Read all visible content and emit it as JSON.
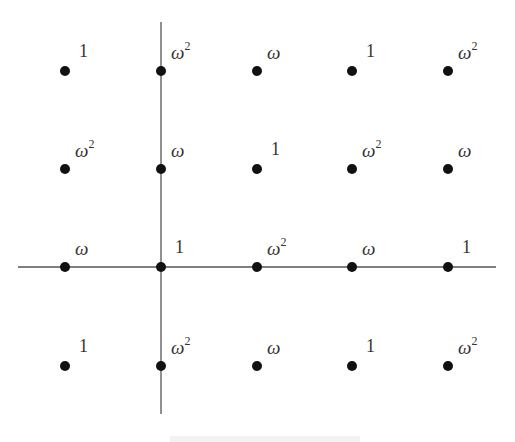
{
  "diagram": {
    "axes": {
      "vertical": {
        "x": 161,
        "y1": 22,
        "y2": 414
      },
      "horizontal": {
        "y": 267,
        "x1": 18,
        "x2": 496
      },
      "color": "#555555"
    },
    "grid": {
      "columns_x": [
        65,
        161,
        257,
        352,
        448
      ],
      "rows_y": [
        71,
        169,
        267,
        366
      ],
      "dot_radius": 5,
      "dot_color": "#111111"
    },
    "rows": [
      {
        "labels": [
          "1",
          "ω2",
          "ω",
          "1",
          "ω2"
        ]
      },
      {
        "labels": [
          "ω2",
          "ω",
          "1",
          "ω2",
          "ω"
        ]
      },
      {
        "labels": [
          "ω",
          "1",
          "ω2",
          "ω",
          "1"
        ]
      },
      {
        "labels": [
          "1",
          "ω2",
          "ω",
          "1",
          "ω2"
        ]
      }
    ],
    "symbols": {
      "one": "1",
      "omega": "ω",
      "exponent": "2"
    },
    "caption_visible": "partially cropped at bottom edge"
  }
}
